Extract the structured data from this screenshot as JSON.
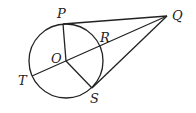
{
  "diagram": {
    "type": "geometry-circle-tangents",
    "labels": {
      "P": "P",
      "Q": "Q",
      "R": "R",
      "O": "O",
      "T": "T",
      "S": "S"
    },
    "points": {
      "O": [
        66,
        61
      ],
      "P": [
        63,
        24
      ],
      "Q": [
        167,
        16
      ],
      "R": [
        101,
        48
      ],
      "T": [
        32,
        76
      ],
      "S": [
        92,
        88
      ]
    },
    "circle": {
      "center": "O",
      "radius": 37
    },
    "segments": [
      [
        "P",
        "Q"
      ],
      [
        "Q",
        "T"
      ],
      [
        "Q",
        "S"
      ],
      [
        "O",
        "P"
      ],
      [
        "O",
        "S"
      ]
    ]
  }
}
